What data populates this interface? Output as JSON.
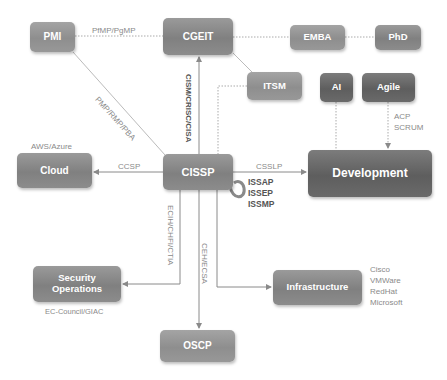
{
  "diagram": {
    "nodes": {
      "pmi": "PMI",
      "cgeit": "CGEIT",
      "emba": "EMBA",
      "phd": "PhD",
      "itsm": "ITSM",
      "ai": "AI",
      "agile": "Agile",
      "cloud": "Cloud",
      "cissp": "CISSP",
      "development": "Development",
      "security_operations": "Security Operations",
      "infrastructure": "Infrastructure",
      "oscp": "OSCP"
    },
    "edge_labels": {
      "pmi_cgeit": "PfMP/PgMP",
      "pmi_cissp": "PMP/RMP/PBA",
      "cissp_cgeit": "CISM/CRISC/CISA",
      "cissp_cloud": "CCSP",
      "cissp_development": "CSSLP",
      "cissp_secops": "ECIH/CHFI/CTIA",
      "cissp_oscp": "CEH/ECSA",
      "agile_development": [
        "ACP",
        "SCRUM"
      ],
      "cissp_self": [
        "ISSAP",
        "ISSEP",
        "ISSMP"
      ]
    },
    "annotations": {
      "cloud": "AWS/Azure",
      "security_operations": "EC-Council/GIAC",
      "infrastructure": [
        "Cisco",
        "VMWare",
        "RedHat",
        "Microsoft"
      ]
    },
    "colors": {
      "node": "#8a8a8a",
      "node_dark": "#666666",
      "line": "#9a9a9a",
      "label": "#8a8a8a"
    }
  }
}
